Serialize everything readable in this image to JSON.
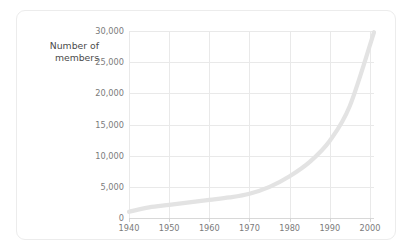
{
  "card": {
    "background": "#ffffff",
    "border_color": "#ececec"
  },
  "chart_data": {
    "type": "line",
    "title": "",
    "subtitle": "",
    "xlabel": "",
    "ylabel": "Number of members",
    "ylabel_lines": [
      "Number of",
      "members"
    ],
    "xlim": [
      1940,
      2001
    ],
    "ylim": [
      0,
      30000
    ],
    "xticks": [
      1940,
      1950,
      1960,
      1970,
      1980,
      1990,
      2000
    ],
    "xtick_labels": [
      "1940",
      "1950",
      "1960",
      "1970",
      "1980",
      "1990",
      "2000"
    ],
    "yticks": [
      0,
      5000,
      10000,
      15000,
      20000,
      25000,
      30000
    ],
    "ytick_labels": [
      "0",
      "5,000",
      "10,000",
      "15,000",
      "20,000",
      "25,000",
      "30,000"
    ],
    "grid": true,
    "legend": false,
    "legend_position": "none",
    "line_color": "#e3e3e3",
    "grid_color": "#e9e9e9",
    "axis_color": "#d8d8d8",
    "tick_label_color": "#7b7b7b",
    "series": [
      {
        "name": "Number of members",
        "x": [
          1940,
          1945,
          1950,
          1955,
          1960,
          1965,
          1970,
          1975,
          1980,
          1985,
          1990,
          1995,
          2001
        ],
        "values": [
          1000,
          1700,
          2100,
          2500,
          2900,
          3300,
          3900,
          5000,
          6700,
          9000,
          12400,
          18000,
          29800
        ]
      }
    ]
  }
}
